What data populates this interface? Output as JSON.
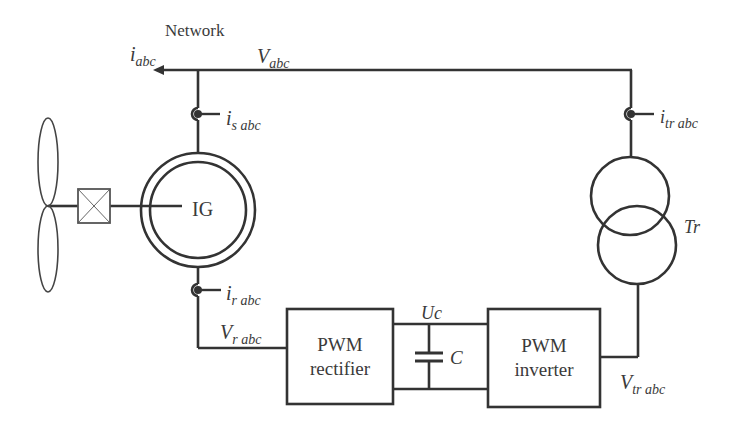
{
  "diagram": {
    "network": {
      "label": "Network",
      "current_symbol": "i",
      "current_sub": "abc",
      "voltage_symbol": "V",
      "voltage_sub": "abc"
    },
    "generator": {
      "label": "IG"
    },
    "stator_current": {
      "symbol": "i",
      "sub": "s abc"
    },
    "rotor_current": {
      "symbol": "i",
      "sub": "r abc"
    },
    "rotor_voltage": {
      "symbol": "V",
      "sub": "r abc"
    },
    "transformer": {
      "label": "Tr"
    },
    "transformer_current": {
      "symbol": "i",
      "sub": "tr abc"
    },
    "transformer_voltage": {
      "symbol": "V",
      "sub": "tr abc"
    },
    "rectifier": {
      "line1": "PWM",
      "line2": "rectifier"
    },
    "inverter": {
      "line1": "PWM",
      "line2": "inverter"
    },
    "dc_link": {
      "voltage_label": "Uc",
      "capacitor_label": "C"
    },
    "colors": {
      "stroke": "#333333",
      "text": "#3a3a3a",
      "background": "#ffffff"
    }
  }
}
